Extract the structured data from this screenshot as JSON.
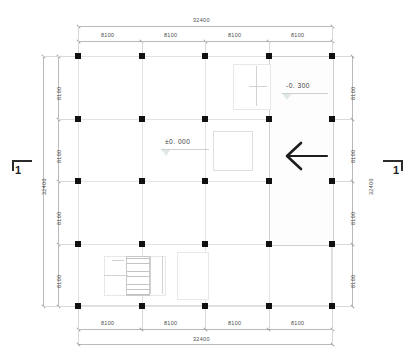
{
  "drawing": {
    "type": "architectural-floor-plan",
    "title": "",
    "units": "mm"
  },
  "dimensions": {
    "top": {
      "overall": "32400",
      "bays": [
        "8100",
        "8100",
        "8100",
        "8100"
      ]
    },
    "bottom": {
      "overall": "32400",
      "bays": [
        "8100",
        "8100",
        "8100",
        "8100"
      ]
    },
    "left": {
      "overall": "32400",
      "bays": [
        "8100",
        "8100",
        "8100",
        "8100"
      ]
    },
    "right": {
      "overall": "32400",
      "bays": [
        "8100",
        "8100",
        "8100",
        "8100"
      ]
    }
  },
  "levels": [
    {
      "id": "level-upper",
      "label": "-0. 300",
      "icon": "level-triangle"
    },
    {
      "id": "level-main",
      "label": "±0. 000",
      "icon": "level-triangle"
    }
  ],
  "section_markers": [
    {
      "id": "section-left",
      "label": "1"
    },
    {
      "id": "section-right",
      "label": "1"
    }
  ],
  "annotations": {
    "direction_arrow": "arrow-left-icon"
  },
  "grid": {
    "columns": 5,
    "rows": 5,
    "column_marker": "structural-column"
  },
  "zones": {
    "paving_hatch": "tiled-paving-zone",
    "stair_upper": "stair-upper",
    "stair_lower": "stair-lower",
    "service_rooms": "service-room-stack",
    "central_room": "central-room"
  },
  "colors": {
    "column": "#111111",
    "line": "#dcdcdc",
    "dimension_text": "#4a4a4a",
    "marker": "#1d1d1d"
  }
}
